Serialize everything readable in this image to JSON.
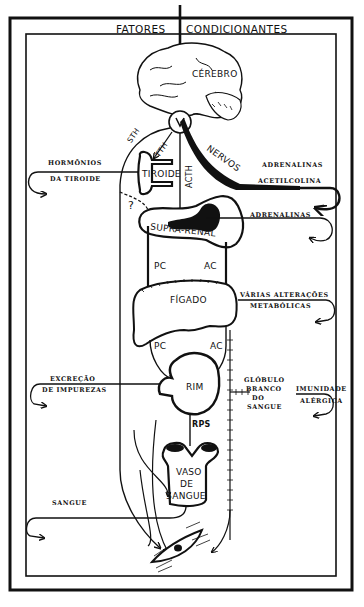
{
  "diagram": {
    "header": {
      "title_left": "FATORES",
      "title_right": "CONDICIONANTES"
    },
    "organs": {
      "brain": "CÉREBRO",
      "thyroid": "TIROIDE",
      "adrenal": "SUPRA-RENAL",
      "liver": "FÍGADO",
      "kidney": "RIM",
      "blood_vessel_line1": "VASO",
      "blood_vessel_line2": "DE",
      "blood_vessel_line3": "SANGUE"
    },
    "pathways": {
      "sth": "STH",
      "tth": "TTH",
      "acth": "ACTH",
      "nerves": "NERVOS",
      "question": "?",
      "pc_upper": "PC",
      "ac_upper": "AC",
      "pc_lower": "PC",
      "ac_lower": "AC",
      "rps": "RPS"
    },
    "outputs": {
      "thyroid_hormones_line1": "HORMÔNIOS",
      "thyroid_hormones_line2": "DA TIROIDE",
      "adrenalines_nerves": "ADRENALINAS",
      "acetylcholine": "ACETILCOLINA",
      "adrenalines_adrenal": "ADRENALINAS",
      "metabolic_line1": "VÁRIAS ALTERAÇÕES",
      "metabolic_line2": "METABÓLICAS",
      "excretion_line1": "EXCREÇÃO",
      "excretion_line2": "DE IMPUREZAS",
      "white_cell_line1": "GLÓBULO",
      "white_cell_line2": "BRANCO",
      "white_cell_line3": "DO",
      "white_cell_line4": "SANGUE",
      "immunity_line1": "IMUNIDADE",
      "immunity_line2": "ALÉRGICA",
      "blood": "SANGUE"
    },
    "colors": {
      "ink": "#111111",
      "paper": "#ffffff"
    }
  }
}
